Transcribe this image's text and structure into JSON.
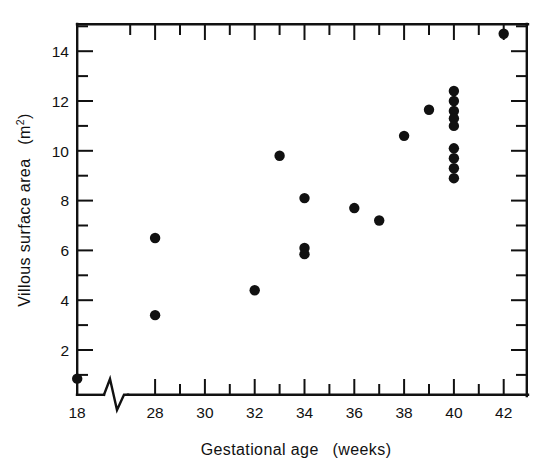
{
  "figure": {
    "background_color": "#ffffff",
    "ink_color": "#111111"
  },
  "chart_data": {
    "type": "scatter",
    "title": "",
    "subtitle": "",
    "xlabel": "Gestational age  (weeks)",
    "ylabel": "Villous surface area  (m",
    "ylabel_superscript": "2",
    "ylabel_suffix": ")",
    "xlabel_parts": {
      "name": "Gestational age",
      "units": "(weeks)"
    },
    "ylabel_parts": {
      "name": "Villous surface area",
      "units": "(m2)"
    },
    "xlim": [
      18,
      43
    ],
    "ylim": [
      0,
      15.2
    ],
    "axis_break": {
      "present": true,
      "style": "zigzag",
      "between": [
        18,
        28
      ],
      "axis": "x"
    },
    "grid": false,
    "legend": false,
    "legend_position": "none",
    "x_ticks_major": [
      18,
      28,
      30,
      32,
      34,
      36,
      38,
      40,
      42
    ],
    "x_tick_labels": [
      "18",
      "28",
      "30",
      "32",
      "34",
      "36",
      "38",
      "40",
      "42"
    ],
    "x_ticks_minor": [
      29,
      31,
      33,
      35,
      37,
      39,
      41,
      43
    ],
    "x_ticks_top_mirrored": true,
    "y_ticks_major": [
      2,
      4,
      6,
      8,
      10,
      12,
      14
    ],
    "y_tick_labels": [
      "2",
      "4",
      "6",
      "8",
      "10",
      "12",
      "14"
    ],
    "y_ticks_minor": [
      1,
      3,
      5,
      7,
      9,
      11,
      13,
      15
    ],
    "y_ticks_right_mirrored": true,
    "marker": {
      "shape": "circle",
      "filled": true,
      "color": "#111111",
      "radius_px": 5.2
    },
    "n_points": 19,
    "points": [
      {
        "x": 18.0,
        "y": 0.85
      },
      {
        "x": 28.0,
        "y": 6.5
      },
      {
        "x": 28.0,
        "y": 3.4
      },
      {
        "x": 32.0,
        "y": 4.4
      },
      {
        "x": 33.0,
        "y": 9.8
      },
      {
        "x": 34.0,
        "y": 8.1
      },
      {
        "x": 34.0,
        "y": 6.1
      },
      {
        "x": 34.0,
        "y": 5.85
      },
      {
        "x": 36.0,
        "y": 7.7
      },
      {
        "x": 37.0,
        "y": 7.2
      },
      {
        "x": 38.0,
        "y": 10.6
      },
      {
        "x": 39.0,
        "y": 11.65
      },
      {
        "x": 40.0,
        "y": 12.4
      },
      {
        "x": 40.0,
        "y": 12.0
      },
      {
        "x": 40.0,
        "y": 11.6
      },
      {
        "x": 40.0,
        "y": 11.3
      },
      {
        "x": 40.0,
        "y": 11.0
      },
      {
        "x": 40.0,
        "y": 10.1
      },
      {
        "x": 40.0,
        "y": 9.7
      },
      {
        "x": 40.0,
        "y": 9.3
      },
      {
        "x": 40.0,
        "y": 8.9
      },
      {
        "x": 42.0,
        "y": 14.7
      }
    ],
    "x": [
      18,
      28,
      28,
      32,
      33,
      34,
      34,
      34,
      36,
      37,
      38,
      39,
      40,
      40,
      40,
      40,
      40,
      40,
      40,
      40,
      40,
      42
    ],
    "values": [
      0.85,
      6.5,
      3.4,
      4.4,
      9.8,
      8.1,
      6.1,
      5.85,
      7.7,
      7.2,
      10.6,
      11.65,
      12.4,
      12.0,
      11.6,
      11.3,
      11.0,
      10.1,
      9.7,
      9.3,
      8.9,
      14.7
    ]
  }
}
